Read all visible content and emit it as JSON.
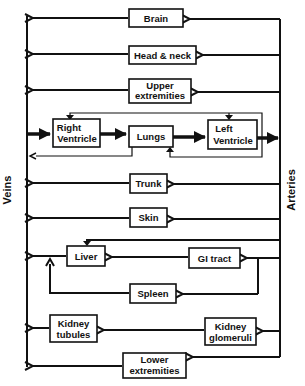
{
  "diagram": {
    "type": "circulatory-flow",
    "side_labels": {
      "left": "Veins",
      "right": "Arteries"
    },
    "organs": {
      "brain": [
        "Brain"
      ],
      "head_neck": [
        "Head & neck"
      ],
      "upper_extremities": [
        "Upper",
        "extremities"
      ],
      "right_ventricle": [
        "Right",
        "Ventricle"
      ],
      "lungs": [
        "Lungs"
      ],
      "left_ventricle": [
        "Left",
        "Ventricle"
      ],
      "trunk": [
        "Trunk"
      ],
      "skin": [
        "Skin"
      ],
      "liver": [
        "Liver"
      ],
      "gi_tract": [
        "GI tract"
      ],
      "spleen": [
        "Spleen"
      ],
      "kidney_tubules": [
        "Kidney",
        "tubules"
      ],
      "kidney_glomeruli": [
        "Kidney",
        "glomeruli"
      ],
      "lower_extremities": [
        "Lower",
        "extremities"
      ]
    },
    "flows": [
      {
        "from": "Arteries",
        "to": "Brain"
      },
      {
        "from": "Brain",
        "to": "Veins"
      },
      {
        "from": "Arteries",
        "to": "Head & neck"
      },
      {
        "from": "Head & neck",
        "to": "Veins"
      },
      {
        "from": "Arteries",
        "to": "Upper extremities"
      },
      {
        "from": "Upper extremities",
        "to": "Veins"
      },
      {
        "from": "Veins",
        "to": "Right Ventricle"
      },
      {
        "from": "Right Ventricle",
        "to": "Lungs"
      },
      {
        "from": "Lungs",
        "to": "Left Ventricle"
      },
      {
        "from": "Left Ventricle",
        "to": "Arteries"
      },
      {
        "from": "Arteries",
        "to": "Trunk"
      },
      {
        "from": "Trunk",
        "to": "Veins"
      },
      {
        "from": "Arteries",
        "to": "Skin"
      },
      {
        "from": "Skin",
        "to": "Veins"
      },
      {
        "from": "Arteries",
        "to": "Liver"
      },
      {
        "from": "Arteries",
        "to": "GI tract"
      },
      {
        "from": "GI tract",
        "to": "Liver"
      },
      {
        "from": "Arteries",
        "to": "Spleen"
      },
      {
        "from": "Spleen",
        "to": "Liver"
      },
      {
        "from": "Liver",
        "to": "Veins"
      },
      {
        "from": "Arteries",
        "to": "Kidney glomeruli"
      },
      {
        "from": "Kidney glomeruli",
        "to": "Kidney tubules"
      },
      {
        "from": "Kidney tubules",
        "to": "Veins"
      },
      {
        "from": "Arteries",
        "to": "Lower extremities"
      },
      {
        "from": "Lower extremities",
        "to": "Veins"
      }
    ]
  }
}
